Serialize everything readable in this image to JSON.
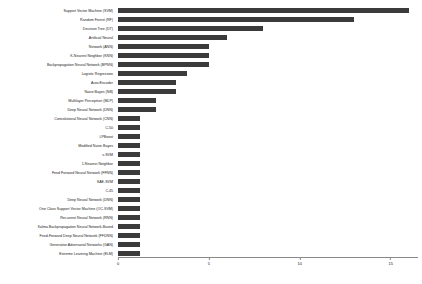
{
  "chart_data": {
    "type": "bar",
    "orientation": "horizontal",
    "title": "",
    "xlabel": "",
    "ylabel": "",
    "xlim": [
      0,
      16.5
    ],
    "xticks": [
      0,
      5,
      10,
      15
    ],
    "grid": false,
    "legend": null,
    "bar_color": "#3b3b3b",
    "axis_color": "#8a8a8a",
    "categories": [
      "Support Vector Machine (SVM)",
      "Random Forest (RF)",
      "Decision Tree (DT)",
      "Artificial Neural",
      "Network (ANN)",
      "K-Nearest Neighbor (KNN)",
      "Backpropagation Neural Network (BPNN)",
      "Logistic Regression",
      "Auto-Encoder",
      "Naive Bayes (NB)",
      "Multilayer Perceptron (MLP)",
      "Deep Neural Network (DNN)",
      "Convolutional Neural Network (CNN)",
      "C-50",
      "LPBoost",
      "Modified Naive Bayes",
      "v-SVM",
      "1-Nearest Neighbor",
      "Feed Forward Neural Network (FFNN)",
      "SAE-SVM",
      "C.45",
      "Deep Neural Network (DNN)",
      "One Class Support Vector Machine (OC-SVM)",
      "Recurrent Neural Network (RNN)",
      "Kalma Backpropagation Neural Network-Based",
      "Feed-Forward Deep Neural Network (FFDNN)",
      "Generative Adversarial Networks (GAN)",
      "Extreme Learning Machine (ELM)"
    ],
    "values": [
      16.0,
      13.0,
      8.0,
      6.0,
      5.0,
      5.0,
      5.0,
      3.8,
      3.2,
      3.2,
      2.1,
      2.1,
      1.2,
      1.2,
      1.2,
      1.2,
      1.2,
      1.2,
      1.2,
      1.2,
      1.2,
      1.2,
      1.2,
      1.2,
      1.2,
      1.2,
      1.2,
      1.2
    ]
  }
}
